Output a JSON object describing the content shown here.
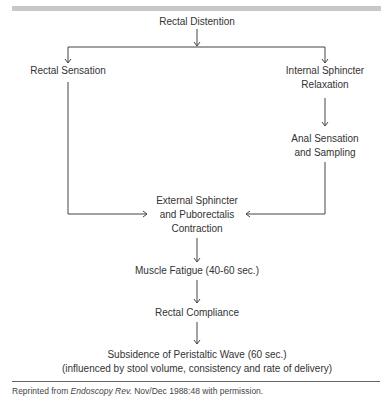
{
  "diagram": {
    "nodes": {
      "rectal_distention": "Rectal Distention",
      "rectal_sensation": "Rectal Sensation",
      "internal_sphincter_1": "Internal Sphincter",
      "internal_sphincter_2": "Relaxation",
      "anal_sensation_1": "Anal Sensation",
      "anal_sensation_2": "and Sampling",
      "external_sphincter_1": "External Sphincter",
      "external_sphincter_2": "and Puborectalis",
      "external_sphincter_3": "Contraction",
      "muscle_fatigue": "Muscle Fatigue (40-60 sec.)",
      "rectal_compliance": "Rectal Compliance",
      "subsidence_1": "Subsidence of Peristaltic Wave (60 sec.)",
      "subsidence_2": "(influenced by stool volume, consistency and rate of delivery)"
    },
    "edges": [
      [
        "Rectal Distention",
        "Rectal Sensation"
      ],
      [
        "Rectal Distention",
        "Internal Sphincter Relaxation"
      ],
      [
        "Internal Sphincter Relaxation",
        "Anal Sensation and Sampling"
      ],
      [
        "Rectal Sensation",
        "External Sphincter and Puborectalis Contraction"
      ],
      [
        "Anal Sensation and Sampling",
        "External Sphincter and Puborectalis Contraction"
      ],
      [
        "External Sphincter and Puborectalis Contraction",
        "Muscle Fatigue (40-60 sec.)"
      ],
      [
        "Muscle Fatigue (40-60 sec.)",
        "Rectal Compliance"
      ],
      [
        "Rectal Compliance",
        "Subsidence of Peristaltic Wave (60 sec.)"
      ]
    ]
  },
  "caption": {
    "prefix": "Reprinted from ",
    "source": "Endoscopy Rev.",
    "suffix": " Nov/Dec 1988:48 with permission."
  }
}
